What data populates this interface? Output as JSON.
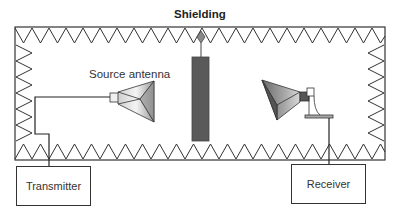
{
  "diagram": {
    "title": "Shielding",
    "labels": {
      "source_antenna": "Source antenna",
      "transmitter": "Transmitter",
      "receiver": "Receiver"
    },
    "colors": {
      "line": "#333333",
      "shield": "#555555",
      "horn_light": "#e0e0e0",
      "horn_dark": "#707070"
    }
  }
}
